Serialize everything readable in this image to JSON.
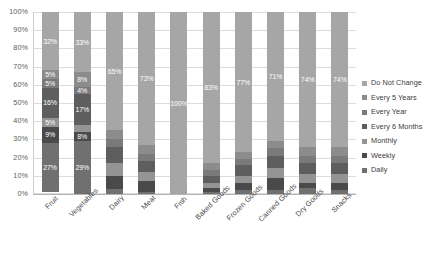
{
  "chart_data": {
    "type": "bar",
    "subtype": "stacked-100-percent",
    "title": "",
    "xlabel": "",
    "ylabel": "",
    "ylim": [
      0,
      100
    ],
    "ytick_labels": [
      "100%",
      "90%",
      "80%",
      "70%",
      "60%",
      "50%",
      "40%",
      "30%",
      "20%",
      "10%",
      "0%"
    ],
    "ytick_values": [
      100,
      90,
      80,
      70,
      60,
      50,
      40,
      30,
      20,
      10,
      0
    ],
    "grid": true,
    "legend_position": "right",
    "categories": [
      "Fruit",
      "Vegetables",
      "Dairy",
      "Meat",
      "Fish",
      "Baked Goods",
      "Frozen Goods",
      "Canned Goods",
      "Dry Goods",
      "Snacks"
    ],
    "series": [
      {
        "name": "Do Not Change",
        "color": "#a6a6a6",
        "values": [
          32,
          33,
          65,
          73,
          100,
          83,
          77,
          71,
          74,
          74
        ]
      },
      {
        "name": "Every 5 Years",
        "color": "#8c8c8c",
        "values": [
          5,
          8,
          5,
          5,
          0,
          4,
          4,
          4,
          5,
          5
        ]
      },
      {
        "name": "Every Year",
        "color": "#7a7a7a",
        "values": [
          5,
          4,
          4,
          4,
          0,
          3,
          3,
          4,
          4,
          4
        ]
      },
      {
        "name": "Every 6 Months",
        "color": "#5e5e5e",
        "values": [
          16,
          17,
          9,
          6,
          0,
          4,
          6,
          7,
          6,
          6
        ]
      },
      {
        "name": "Monthly",
        "color": "#949494",
        "values": [
          5,
          4,
          7,
          5,
          0,
          3,
          4,
          5,
          5,
          5
        ]
      },
      {
        "name": "Weekly",
        "color": "#4a4a4a",
        "values": [
          9,
          5,
          7,
          6,
          0,
          2,
          4,
          7,
          3,
          4
        ]
      },
      {
        "name": "Daily",
        "color": "#707070",
        "values": [
          27,
          29,
          3,
          1,
          0,
          1,
          2,
          2,
          3,
          2
        ]
      }
    ],
    "data_labels": {
      "Fruit": [
        "32%",
        "5%",
        "5%",
        "16%",
        "5%",
        "9%",
        "27%"
      ],
      "Vegetables": [
        "33%",
        "8%",
        "4%",
        "17%",
        "",
        "8%",
        "29%"
      ],
      "Dairy": [
        "65%",
        "",
        "",
        "",
        "",
        "",
        ""
      ],
      "Meat": [
        "73%",
        "",
        "",
        "",
        "",
        "",
        ""
      ],
      "Fish": [
        "100%",
        "",
        "",
        "",
        "",
        "",
        ""
      ],
      "Baked Goods": [
        "83%",
        "",
        "",
        "",
        "",
        "",
        ""
      ],
      "Frozen Goods": [
        "77%",
        "",
        "",
        "",
        "",
        "",
        ""
      ],
      "Canned Goods": [
        "71%",
        "",
        "",
        "",
        "",
        "",
        ""
      ],
      "Dry Goods": [
        "74%",
        "",
        "",
        "",
        "",
        "",
        ""
      ],
      "Snacks": [
        "74%",
        "",
        "",
        "",
        "",
        "",
        ""
      ]
    }
  },
  "legend": {
    "items": [
      {
        "label": "Do Not Change",
        "color": "#a6a6a6"
      },
      {
        "label": "Every 5 Years",
        "color": "#8c8c8c"
      },
      {
        "label": "Every Year",
        "color": "#7a7a7a"
      },
      {
        "label": "Every 6 Months",
        "color": "#5e5e5e"
      },
      {
        "label": "Monthly",
        "color": "#949494"
      },
      {
        "label": "Weekly",
        "color": "#4a4a4a"
      },
      {
        "label": "Daily",
        "color": "#707070"
      }
    ]
  }
}
